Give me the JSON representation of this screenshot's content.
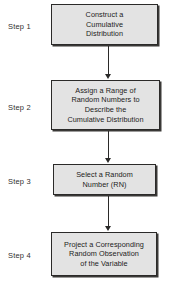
{
  "diagram": {
    "type": "flowchart",
    "orientation": "vertical",
    "background_color": "#ffffff",
    "node_fill_color": "#e3e3e3",
    "node_border_color": "#2b2a29",
    "connector_color": "#2b2a29",
    "steps": [
      {
        "label": "Step 1",
        "text": "Construct a\nCumulative\nDistribution"
      },
      {
        "label": "Step 2",
        "text": "Assign a Range of\nRandom Numbers to\nDescribe the\nCumulative Distribution"
      },
      {
        "label": "Step 3",
        "text": "Select a Random\nNumber (RN)"
      },
      {
        "label": "Step 4",
        "text": "Project a Corresponding\nRandom Observation\nof the Variable"
      }
    ],
    "connectors": [
      {
        "name": "arrow-step1-to-step2"
      },
      {
        "name": "arrow-step2-to-step3"
      },
      {
        "name": "arrow-step3-to-step4"
      }
    ]
  }
}
